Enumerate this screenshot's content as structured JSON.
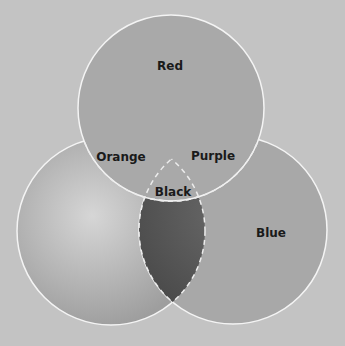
{
  "diagram": {
    "type": "venn",
    "background_color": "#c3c3c3",
    "circles": [
      {
        "name": "Red",
        "cx": 171,
        "cy": 108,
        "r": 93,
        "fill": "#a9a9a9"
      },
      {
        "name": "Yellow",
        "cx": 111,
        "cy": 231,
        "r": 94,
        "fill": "#b9b9b9"
      },
      {
        "name": "Blue",
        "cx": 233,
        "cy": 230,
        "r": 94,
        "fill": "#a8a8a8"
      }
    ],
    "labels": {
      "red": "Red",
      "orange": "Orange",
      "purple": "Purple",
      "black": "Black",
      "blue": "Blue"
    },
    "dark_region_color": "#575757"
  }
}
